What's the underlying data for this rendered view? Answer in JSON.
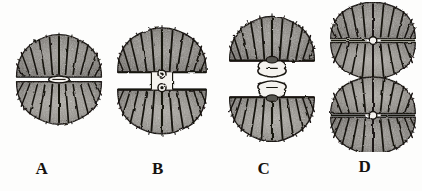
{
  "figure": {
    "title": "Stages in cell division of a desmid",
    "medium": "halftone engraving",
    "background_color": "#fdfdfc",
    "ink_color": "#16120f",
    "cytoplasm_color": "#8d8a85",
    "panel_count": 4
  },
  "panels": [
    {
      "id": "A",
      "label": "A",
      "stage_name": "undivided cell",
      "description": "Round cell with two semicells joined at a narrow lens-shaped isthmus; radial spines and crenulate margin.",
      "semicell_count": 2,
      "isthmus_type": "narrow-lens",
      "gap_px": 0,
      "label_x": 42,
      "label_y": 160,
      "cell_x": 10,
      "cell_y": 22,
      "cell_w": 98,
      "cell_h": 112,
      "radial_spines": 18
    },
    {
      "id": "B",
      "label": "B",
      "stage_name": "early separation",
      "description": "Semicells drawn apart; isthmus elongated into a short neck bearing two small ring-like nuclei.",
      "semicell_count": 2,
      "isthmus_type": "short-neck-two-rings",
      "gap_px": 12,
      "label_x": 155,
      "label_y": 160,
      "cell_x": 112,
      "cell_y": 18,
      "cell_w": 100,
      "cell_h": 122,
      "radial_spines": 18
    },
    {
      "id": "C",
      "label": "C",
      "stage_name": "new semicell formation",
      "description": "Semicells widely separated; between them a lobed hourglass structure of two forming semicells.",
      "semicell_count": 2,
      "isthmus_type": "lobed-hourglass",
      "gap_px": 30,
      "label_x": 262,
      "label_y": 160,
      "cell_x": 222,
      "cell_y": 12,
      "cell_w": 100,
      "cell_h": 130,
      "radial_spines": 18
    },
    {
      "id": "D",
      "label": "D",
      "stage_name": "two daughter cells",
      "description": "Division complete: two separate complete cells, each with its own central isthmus, stacked vertically.",
      "semicell_count": 4,
      "isthmus_type": "two-complete-cells",
      "gap_px": 6,
      "label_x": 362,
      "label_y": 158,
      "cell_x": 326,
      "cell_y": 2,
      "cell_w": 94,
      "cell_h": 150,
      "radial_spines": 18
    }
  ]
}
